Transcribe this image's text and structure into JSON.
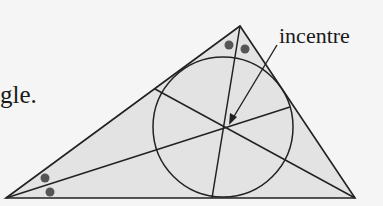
{
  "text_fragment": "gle.",
  "annotation": "incentre",
  "colors": {
    "background": "#f5f5f5",
    "triangle_fill": "#e3e3e3",
    "stroke": "#222222",
    "angle_marks": "#555555"
  },
  "geometry": {
    "vertices": {
      "left": [
        6,
        198
      ],
      "apex": [
        240,
        26
      ],
      "right": [
        355,
        198
      ]
    },
    "incentre": [
      225,
      128
    ],
    "incircle": {
      "cx": 223,
      "cy": 127,
      "r": 70
    }
  }
}
